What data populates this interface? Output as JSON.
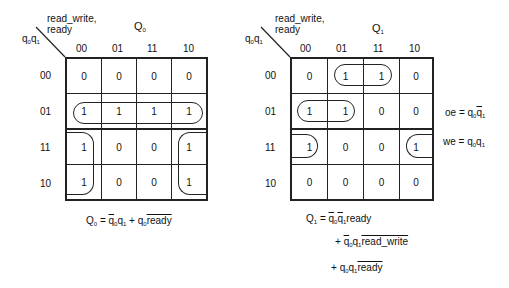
{
  "kmap_q0": {
    "corner_top": "read_write,",
    "corner_top2": "ready",
    "corner_left": "q",
    "title": "Q",
    "title_sub": "0",
    "columns": [
      "00",
      "01",
      "11",
      "10"
    ],
    "rows": [
      "00",
      "01",
      "11",
      "10"
    ],
    "cells": [
      [
        "0",
        "0",
        "0",
        "0"
      ],
      [
        "1",
        "1",
        "1",
        "1"
      ],
      [
        "1",
        "0",
        "0",
        "1"
      ],
      [
        "1",
        "0",
        "0",
        "1"
      ]
    ],
    "equation": {
      "lhs": "Q",
      "lhs_sub": "0",
      "eq": " = ",
      "t1a": "q",
      "t1a_sub": "0",
      "t1b": "q",
      "t1b_sub": "1",
      "plus": " + ",
      "t2a": "q",
      "t2a_sub": "0",
      "t2b": "ready"
    }
  },
  "kmap_q1": {
    "corner_top": "read_write,",
    "corner_top2": "ready",
    "title": "Q",
    "title_sub": "1",
    "columns": [
      "00",
      "01",
      "11",
      "10"
    ],
    "rows": [
      "00",
      "01",
      "11",
      "10"
    ],
    "cells": [
      [
        "0",
        "1",
        "1",
        "0"
      ],
      [
        "1",
        "1",
        "0",
        "0"
      ],
      [
        "1",
        "0",
        "0",
        "1"
      ],
      [
        "0",
        "0",
        "0",
        "0"
      ]
    ],
    "side_eq1": {
      "lhs": "oe = q",
      "s1": "0",
      "q": "q",
      "s2": "1"
    },
    "side_eq2": {
      "lhs": "we = q",
      "s1": "0",
      "q": "q",
      "s2": "1"
    },
    "equation": {
      "line1": {
        "lhs": "Q",
        "lhs_sub": "1",
        "eq": " = ",
        "a": "q",
        "a_sub": "0",
        "b": "q",
        "b_sub": "1",
        "c": "ready"
      },
      "line2": {
        "plus": "+ ",
        "a": "q",
        "a_sub": "0",
        "b": "q",
        "b_sub": "1",
        "c": "read_write"
      },
      "line3": {
        "plus": "+ ",
        "a": "q",
        "a_sub": "0",
        "b": "q",
        "b_sub": "1",
        "c": "ready"
      }
    }
  }
}
